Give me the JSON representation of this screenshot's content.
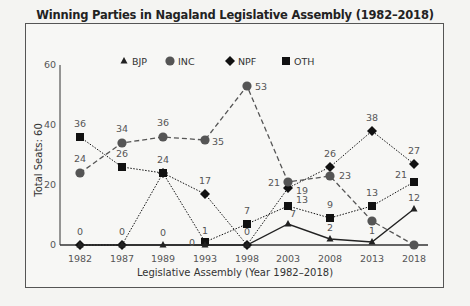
{
  "chart_data": {
    "type": "line",
    "title": "Winning Parties in Nagaland Legislative Assembly (1982–2018)",
    "xlabel": "Legislative Assembly (Year 1982–2018)",
    "ylabel": "Total Seats: 60",
    "ylim": [
      0,
      60
    ],
    "yticks": [
      0,
      20,
      40,
      60
    ],
    "grid": false,
    "legend_position": "top",
    "categories": [
      "1982",
      "1987",
      "1989",
      "1993",
      "1998",
      "2003",
      "2008",
      "2013",
      "2018"
    ],
    "series": [
      {
        "name": "BJP",
        "marker": "triangle",
        "line": "solid",
        "values": [
          0,
          0,
          0,
          0,
          0,
          7,
          2,
          1,
          12
        ],
        "labels": [
          null,
          null,
          "0",
          "0",
          null,
          "7",
          "2",
          "1",
          "12"
        ]
      },
      {
        "name": "INC",
        "marker": "circle",
        "line": "dashed",
        "values": [
          24,
          34,
          36,
          35,
          53,
          21,
          23,
          8,
          0
        ],
        "labels": [
          "24",
          "34",
          "36",
          "35",
          "53",
          "21",
          "23",
          null,
          null
        ]
      },
      {
        "name": "NPF",
        "marker": "diamond",
        "line": "dotted",
        "values": [
          0,
          0,
          24,
          17,
          0,
          19,
          26,
          38,
          27
        ],
        "labels": [
          "0",
          "0",
          null,
          "17",
          "0",
          "19",
          "26",
          "38",
          "27"
        ]
      },
      {
        "name": "OTH",
        "marker": "square",
        "line": "dotted",
        "values": [
          36,
          26,
          24,
          1,
          7,
          13,
          9,
          13,
          21
        ],
        "labels": [
          "36",
          "26",
          "24",
          "1",
          "7",
          "13",
          "9",
          "13",
          "21"
        ]
      }
    ]
  }
}
